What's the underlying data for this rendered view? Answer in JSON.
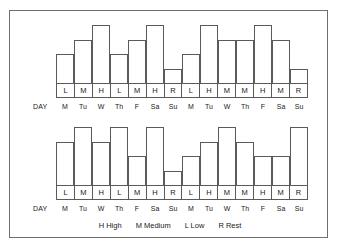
{
  "figure": {
    "border_color": "#6e6e6e",
    "day_axis_label": "DAY",
    "days": [
      "M",
      "Tu",
      "W",
      "Th",
      "F",
      "Sa",
      "Su",
      "M",
      "Tu",
      "W",
      "Th",
      "F",
      "Sa",
      "Su"
    ]
  },
  "legend": {
    "items": [
      {
        "key": "H",
        "text": "H High"
      },
      {
        "key": "M",
        "text": "M Medium"
      },
      {
        "key": "L",
        "text": "L Low"
      },
      {
        "key": "R",
        "text": "R Rest"
      }
    ]
  },
  "chart_data": [
    {
      "type": "bar",
      "name": "top-schedule",
      "title": "",
      "xlabel": "DAY",
      "ylabel": "",
      "grid": false,
      "legend_position": "bottom",
      "ylim": [
        0,
        4
      ],
      "categories": [
        "M",
        "Tu",
        "W",
        "Th",
        "F",
        "Sa",
        "Su",
        "M",
        "Tu",
        "W",
        "Th",
        "F",
        "Sa",
        "Su"
      ],
      "intensity_labels": [
        "L",
        "M",
        "H",
        "L",
        "M",
        "H",
        "R",
        "L",
        "H",
        "M",
        "M",
        "H",
        "M",
        "R"
      ],
      "values": [
        2,
        3,
        4,
        2,
        3,
        4,
        1,
        2,
        4,
        3,
        3,
        4,
        3,
        1
      ],
      "value_key": {
        "H": 4,
        "M": 3,
        "L": 2,
        "R": 1
      }
    },
    {
      "type": "bar",
      "name": "bottom-schedule",
      "title": "",
      "xlabel": "DAY",
      "ylabel": "",
      "grid": false,
      "legend_position": "bottom",
      "ylim": [
        0,
        4
      ],
      "categories": [
        "M",
        "Tu",
        "W",
        "Th",
        "F",
        "Sa",
        "Su",
        "M",
        "Tu",
        "W",
        "Th",
        "F",
        "Sa",
        "Su"
      ],
      "intensity_labels": [
        "L",
        "M",
        "H",
        "L",
        "M",
        "H",
        "R",
        "L",
        "H",
        "M",
        "M",
        "H",
        "M",
        "R"
      ],
      "values": [
        3,
        4,
        3,
        4,
        2,
        4,
        1,
        2,
        3,
        4,
        3,
        2,
        2,
        4
      ],
      "value_key": {
        "H": 4,
        "M": 3,
        "L": 2,
        "R": 1
      }
    }
  ]
}
